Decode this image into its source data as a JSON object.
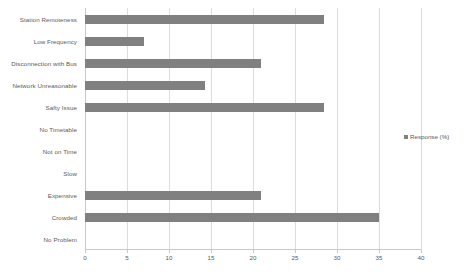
{
  "chart_data": {
    "type": "bar",
    "orientation": "horizontal",
    "title": "",
    "xlabel": "",
    "ylabel": "",
    "xlim": [
      0,
      40
    ],
    "xticks": [
      0,
      5,
      10,
      15,
      20,
      25,
      30,
      35,
      40
    ],
    "xtick_labels": [
      "0",
      "5",
      "10",
      "15",
      "20",
      "25",
      "30",
      "35",
      "40"
    ],
    "grid": true,
    "legend_position": "right",
    "categories": [
      "Station Remoteness",
      "Low Frequency",
      "Disconnection with Bus",
      "Network Unreasonable",
      "Safty Issue",
      "No Timetable",
      "Not on Time",
      "Slow",
      "Expensive",
      "Crowded",
      "No Problem"
    ],
    "series": [
      {
        "name": "Response (%)",
        "color": "#808080",
        "values": [
          28.5,
          7,
          21,
          14.3,
          28.5,
          0,
          0,
          0,
          21,
          35,
          0
        ]
      }
    ]
  },
  "legend": {
    "entries": [
      {
        "label": "Response (%)",
        "color": "#808080"
      }
    ]
  },
  "colors": {
    "bar": "#808080",
    "gridline": "#dcdcdc",
    "axis": "#c9c9c9",
    "text": "#5a5a5a",
    "background": "#ffffff"
  }
}
